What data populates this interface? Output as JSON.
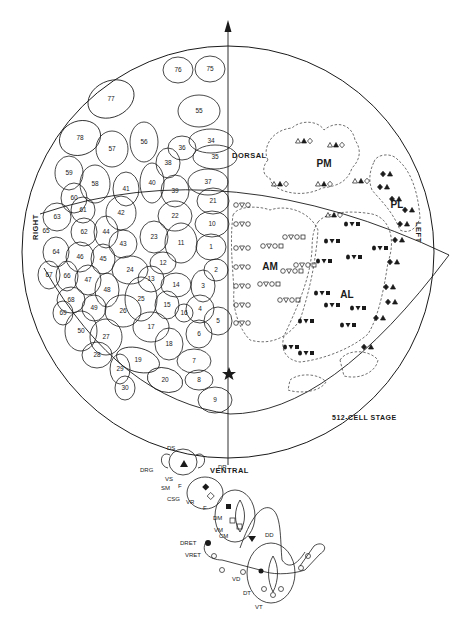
{
  "figure": {
    "stage_label": "512-CELL STAGE",
    "axes": {
      "dorsal": "DORSAL",
      "ventral": "VENTRAL",
      "right": "RIGHT",
      "left": "LEFT"
    },
    "regions": {
      "pm": "PM",
      "pl": "PL",
      "am": "AM",
      "al": "AL"
    },
    "right_half_blastomeres": [
      {
        "n": "76",
        "x": 178,
        "y": 70
      },
      {
        "n": "75",
        "x": 210,
        "y": 69
      },
      {
        "n": "77",
        "x": 111,
        "y": 99
      },
      {
        "n": "55",
        "x": 199,
        "y": 111
      },
      {
        "n": "78",
        "x": 80,
        "y": 138
      },
      {
        "n": "57",
        "x": 112,
        "y": 149
      },
      {
        "n": "56",
        "x": 144,
        "y": 142
      },
      {
        "n": "36",
        "x": 182,
        "y": 148
      },
      {
        "n": "34",
        "x": 211,
        "y": 141
      },
      {
        "n": "35",
        "x": 215,
        "y": 157
      },
      {
        "n": "38",
        "x": 168,
        "y": 163
      },
      {
        "n": "37",
        "x": 208,
        "y": 182
      },
      {
        "n": "59",
        "x": 69,
        "y": 173
      },
      {
        "n": "58",
        "x": 95,
        "y": 184
      },
      {
        "n": "41",
        "x": 126,
        "y": 189
      },
      {
        "n": "40",
        "x": 152,
        "y": 183
      },
      {
        "n": "39",
        "x": 175,
        "y": 191
      },
      {
        "n": "21",
        "x": 213,
        "y": 201
      },
      {
        "n": "60",
        "x": 74,
        "y": 198
      },
      {
        "n": "61",
        "x": 83,
        "y": 210
      },
      {
        "n": "42",
        "x": 121,
        "y": 213
      },
      {
        "n": "22",
        "x": 175,
        "y": 216
      },
      {
        "n": "10",
        "x": 212,
        "y": 224
      },
      {
        "n": "63",
        "x": 57,
        "y": 217
      },
      {
        "n": "65",
        "x": 46,
        "y": 231
      },
      {
        "n": "62",
        "x": 84,
        "y": 232
      },
      {
        "n": "44",
        "x": 106,
        "y": 232
      },
      {
        "n": "43",
        "x": 123,
        "y": 244
      },
      {
        "n": "23",
        "x": 154,
        "y": 237
      },
      {
        "n": "11",
        "x": 181,
        "y": 243
      },
      {
        "n": "1",
        "x": 211,
        "y": 247
      },
      {
        "n": "64",
        "x": 56,
        "y": 252
      },
      {
        "n": "46",
        "x": 80,
        "y": 257
      },
      {
        "n": "45",
        "x": 103,
        "y": 259
      },
      {
        "n": "12",
        "x": 163,
        "y": 263
      },
      {
        "n": "2",
        "x": 216,
        "y": 270
      },
      {
        "n": "24",
        "x": 130,
        "y": 270
      },
      {
        "n": "67",
        "x": 49,
        "y": 275
      },
      {
        "n": "66",
        "x": 67,
        "y": 276
      },
      {
        "n": "47",
        "x": 88,
        "y": 280
      },
      {
        "n": "13",
        "x": 151,
        "y": 279
      },
      {
        "n": "14",
        "x": 176,
        "y": 285
      },
      {
        "n": "3",
        "x": 203,
        "y": 286
      },
      {
        "n": "48",
        "x": 107,
        "y": 290
      },
      {
        "n": "68",
        "x": 71,
        "y": 300
      },
      {
        "n": "49",
        "x": 94,
        "y": 308
      },
      {
        "n": "25",
        "x": 141,
        "y": 299
      },
      {
        "n": "15",
        "x": 167,
        "y": 305
      },
      {
        "n": "4",
        "x": 200,
        "y": 309
      },
      {
        "n": "69",
        "x": 63,
        "y": 313
      },
      {
        "n": "26",
        "x": 123,
        "y": 311
      },
      {
        "n": "16",
        "x": 184,
        "y": 313
      },
      {
        "n": "5",
        "x": 218,
        "y": 321
      },
      {
        "n": "50",
        "x": 81,
        "y": 331
      },
      {
        "n": "17",
        "x": 151,
        "y": 327
      },
      {
        "n": "6",
        "x": 199,
        "y": 334
      },
      {
        "n": "27",
        "x": 106,
        "y": 337
      },
      {
        "n": "18",
        "x": 169,
        "y": 344
      },
      {
        "n": "28",
        "x": 97,
        "y": 355
      },
      {
        "n": "19",
        "x": 138,
        "y": 360
      },
      {
        "n": "7",
        "x": 194,
        "y": 361
      },
      {
        "n": "29",
        "x": 120,
        "y": 369
      },
      {
        "n": "20",
        "x": 165,
        "y": 380
      },
      {
        "n": "8",
        "x": 199,
        "y": 380
      },
      {
        "n": "30",
        "x": 125,
        "y": 388
      },
      {
        "n": "9",
        "x": 215,
        "y": 400
      }
    ],
    "left_half_labels": {
      "pm_cells": [
        "10",
        "13",
        "16",
        "11",
        "7",
        "31"
      ],
      "pl_cells": [
        "2",
        "6",
        "5",
        "3",
        "5",
        "1"
      ],
      "f_marks": [
        "F",
        "F",
        "F",
        "F"
      ],
      "m_mark": "M"
    },
    "bottom_key": {
      "labels": [
        "DS",
        "DRG",
        "VS",
        "SM",
        "CSG",
        "F",
        "DR",
        "VR",
        "F",
        "DM",
        "VM",
        "CM",
        "DD",
        "DRET",
        "VRET",
        "VD",
        "DT",
        "VT"
      ]
    }
  },
  "colors": {
    "ink": "#1a1a1a",
    "paper": "#ffffff"
  }
}
